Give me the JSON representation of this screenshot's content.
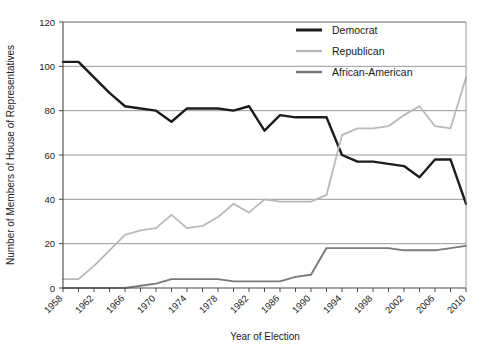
{
  "chart_data": {
    "type": "line",
    "title": "",
    "xlabel": "Year of Election",
    "ylabel": "Number of Members of House of Representatives",
    "xlim": [
      1958,
      2010
    ],
    "ylim": [
      0,
      120
    ],
    "ytick_step": 20,
    "yticks": [
      0,
      20,
      40,
      60,
      80,
      100,
      120
    ],
    "xticks": [
      1958,
      1962,
      1966,
      1970,
      1974,
      1978,
      1982,
      1986,
      1990,
      1994,
      1998,
      2002,
      2006,
      2010
    ],
    "xtick_labels": [
      "1958",
      "1962",
      "1966",
      "1970",
      "1974",
      "1978",
      "1982",
      "1986",
      "1990",
      "1994",
      "1998",
      "2002",
      "2006",
      "2010"
    ],
    "minor_x_step": 2,
    "grid": "horizontal",
    "legend_position": "top-right",
    "x": [
      1958,
      1960,
      1962,
      1964,
      1966,
      1968,
      1970,
      1972,
      1974,
      1976,
      1978,
      1980,
      1982,
      1984,
      1986,
      1988,
      1990,
      1992,
      1994,
      1996,
      1998,
      2000,
      2002,
      2004,
      2006,
      2008,
      2010
    ],
    "series": [
      {
        "name": "Democrat",
        "color": "#1c1c1c",
        "width": 2.4,
        "values": [
          102,
          102,
          95,
          88,
          82,
          81,
          80,
          75,
          81,
          81,
          81,
          80,
          82,
          71,
          78,
          77,
          77,
          77,
          60,
          57,
          57,
          56,
          55,
          50,
          58,
          58,
          38
        ]
      },
      {
        "name": "Republican",
        "color": "#b9b9b9",
        "width": 1.8,
        "values": [
          4,
          4,
          10,
          17,
          24,
          26,
          27,
          33,
          27,
          28,
          32,
          38,
          34,
          40,
          39,
          39,
          39,
          42,
          69,
          72,
          72,
          73,
          78,
          82,
          73,
          72,
          95
        ]
      },
      {
        "name": "African-American",
        "color": "#7a7a7a",
        "width": 1.9,
        "values": [
          0,
          0,
          0,
          0,
          0,
          1,
          2,
          4,
          4,
          4,
          4,
          3,
          3,
          3,
          3,
          5,
          6,
          18,
          18,
          18,
          18,
          18,
          17,
          17,
          17,
          18,
          19
        ]
      }
    ]
  },
  "legend": {
    "items": [
      {
        "label": "Democrat"
      },
      {
        "label": "Republican"
      },
      {
        "label": "African-American"
      }
    ]
  },
  "axes": {
    "y_title": "Number of Members of House of Representatives",
    "x_title": "Year of Election"
  }
}
